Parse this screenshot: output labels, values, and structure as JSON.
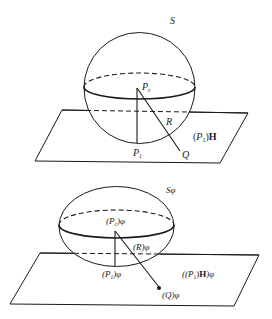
{
  "top_figure": {
    "title": "S",
    "labels": {
      "center": "P",
      "center_sub": "c",
      "foot": "P",
      "foot_sub": "1",
      "radius": "R",
      "point": "Q",
      "plane_open": "(",
      "plane_p": "P",
      "plane_sub": "1",
      "plane_close": ")",
      "plane_h": "H"
    }
  },
  "bottom_figure": {
    "title": "Sφ",
    "labels": {
      "center": "(P",
      "center_sub": "c",
      "center_tail": ")φ",
      "foot": "(P",
      "foot_sub": "1",
      "foot_tail": ")φ",
      "radius": "(R)φ",
      "point": "(Q)φ",
      "plane_open": "((P",
      "plane_sub": "1",
      "plane_close": ")",
      "plane_h": "H",
      "plane_tail": ")φ"
    }
  },
  "colors": {
    "stroke": "#1a1a1a",
    "background": "#ffffff"
  }
}
